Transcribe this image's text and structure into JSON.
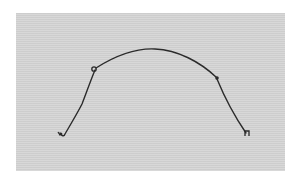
{
  "image": {
    "description": "Photograph of a bent wire shaped like an arch with hooked ends on a gray background",
    "colors": {
      "page_background": "#ffffff",
      "panel_background": "#d4d4d4",
      "wire": "#2a2a2a"
    },
    "wire": {
      "left_end_hook": [
        60,
        133
      ],
      "left_bend_loop": [
        95,
        69
      ],
      "apex": [
        153,
        49
      ],
      "right_bend_knot": [
        217,
        79
      ],
      "right_end_hook": [
        248,
        134
      ]
    }
  }
}
